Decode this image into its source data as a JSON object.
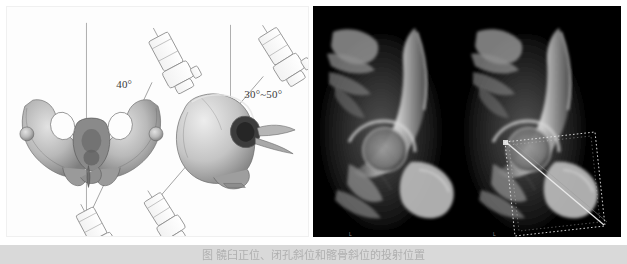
{
  "figure": {
    "caption": "图  髐臼正位、闭孔斜位和髂骨斜位的投射位置",
    "background_color": "#ffffff",
    "caption_bar_color": "#d9d9d9",
    "caption_text_color": "#8e8e8e"
  },
  "left_panel": {
    "name": "positioning-schematic",
    "background_color": "#fdfdfd",
    "annotations": [
      {
        "id": "angle-ap",
        "label": "40°",
        "x": 118,
        "y": 78
      },
      {
        "id": "angle-oblique",
        "label": "30°~50°",
        "x": 228,
        "y": 90
      }
    ],
    "objects": [
      {
        "id": "pelvis-ap-view",
        "type": "bone-illustration",
        "description": "pelvis anteroposterior"
      },
      {
        "id": "pelvis-oblique-view",
        "type": "bone-illustration",
        "description": "pelvis oblique / hemipelvis"
      },
      {
        "id": "xray-tube-upper-left",
        "type": "c-arm-tube"
      },
      {
        "id": "xray-tube-lower-left",
        "type": "c-arm-tube"
      },
      {
        "id": "xray-tube-upper-right",
        "type": "c-arm-tube"
      },
      {
        "id": "xray-tube-lower-right",
        "type": "c-arm-tube"
      },
      {
        "id": "axis-line-left",
        "type": "vertical-reference-line"
      },
      {
        "id": "axis-line-right",
        "type": "vertical-reference-line"
      }
    ]
  },
  "right_panel": {
    "name": "radiograph-pair",
    "background_color": "#000000",
    "images": [
      {
        "id": "radiograph-plain",
        "label": "L",
        "position": "left",
        "description": "hip / acetabulum fluoroscopic view, no overlay"
      },
      {
        "id": "radiograph-annotated",
        "label": "L",
        "position": "right",
        "description": "hip / acetabulum fluoroscopic view with dotted quadrilateral overlay and diagonal line",
        "overlay": {
          "type": "dotted-quadrilateral-with-diagonal",
          "stroke_color": "#e8e8e8"
        }
      }
    ]
  }
}
